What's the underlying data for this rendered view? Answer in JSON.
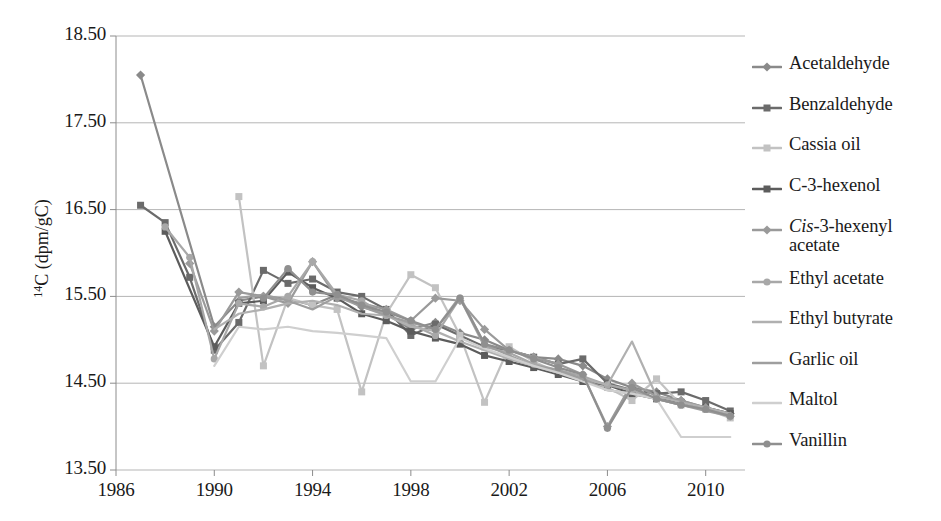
{
  "chart_data": {
    "type": "line",
    "title": "",
    "xlabel": "",
    "ylabel": "14C (dpm/gC)",
    "ylabel_sup": "14",
    "ylabel_rest": "C (dpm/gC)",
    "xlim": [
      1986,
      2011.6
    ],
    "ylim": [
      13.5,
      18.5
    ],
    "grid": true,
    "legend_position": "right",
    "y_ticks": [
      "18.50",
      "17.50",
      "16.50",
      "15.50",
      "14.50",
      "13.50"
    ],
    "y_tick_values": [
      18.5,
      17.5,
      16.5,
      15.5,
      14.5,
      13.5
    ],
    "x_ticks": [
      "1986",
      "1990",
      "1994",
      "1998",
      "2002",
      "2006",
      "2010"
    ],
    "x_tick_values": [
      1986,
      1990,
      1994,
      1998,
      2002,
      2006,
      2010
    ],
    "series": [
      {
        "name": "Acetaldehyde",
        "color": "#8a8a8a",
        "marker": "diamond",
        "x": [
          1987,
          1990,
          1991,
          1992,
          1993,
          1994,
          1995,
          1996,
          1997,
          1998,
          1999,
          2000,
          2001,
          2002,
          2003,
          2004,
          2005,
          2006,
          2007,
          2008,
          2009,
          2010,
          2011
        ],
        "values": [
          18.05,
          15.15,
          15.45,
          15.5,
          15.47,
          15.4,
          15.52,
          15.38,
          15.3,
          15.12,
          15.2,
          15.08,
          15.0,
          14.88,
          14.8,
          14.78,
          14.7,
          14.55,
          14.45,
          14.4,
          14.3,
          14.22,
          14.15
        ]
      },
      {
        "name": "Benzaldehyde",
        "color": "#6b6b6b",
        "marker": "square",
        "x": [
          1987,
          1988,
          1989,
          1990,
          1991,
          1992,
          1993,
          1994,
          1995,
          1996,
          1997,
          1998,
          1999,
          2000,
          2001,
          2002,
          2003,
          2004,
          2005,
          2006,
          2007,
          2008,
          2009,
          2010,
          2011
        ],
        "values": [
          16.55,
          16.35,
          15.72,
          14.88,
          15.2,
          15.8,
          15.65,
          15.7,
          15.55,
          15.5,
          15.35,
          15.05,
          15.18,
          15.05,
          14.92,
          14.88,
          14.8,
          14.72,
          14.78,
          14.5,
          14.42,
          14.38,
          14.4,
          14.3,
          14.18
        ]
      },
      {
        "name": "Cassia oil",
        "color": "#c2c2c2",
        "marker": "square",
        "x": [
          1991,
          1992,
          1993,
          1994,
          1995,
          1996,
          1997,
          1998,
          1999,
          2000,
          2001,
          2002,
          2003,
          2004,
          2005,
          2006,
          2007,
          2008,
          2009,
          2010,
          2011
        ],
        "values": [
          16.65,
          14.7,
          15.48,
          15.4,
          15.35,
          14.4,
          15.3,
          15.75,
          15.6,
          15.05,
          14.28,
          14.92,
          14.75,
          14.62,
          14.55,
          14.45,
          14.3,
          14.55,
          14.25,
          14.2,
          14.1
        ]
      },
      {
        "name": "C-3-hexenol",
        "color": "#5c5c5c",
        "marker": "square",
        "x": [
          1988,
          1990,
          1991,
          1992,
          1993,
          1994,
          1995,
          1996,
          1997,
          1998,
          1999,
          2000,
          2001,
          2002,
          2003,
          2004,
          2005,
          2006,
          2007,
          2008,
          2009,
          2010,
          2011
        ],
        "values": [
          16.25,
          14.92,
          15.42,
          15.45,
          15.78,
          15.6,
          15.48,
          15.3,
          15.22,
          15.1,
          15.02,
          14.95,
          14.82,
          14.75,
          14.68,
          14.6,
          14.52,
          14.48,
          14.38,
          14.32,
          14.28,
          14.22,
          14.15
        ]
      },
      {
        "name": "Cis-3-hexenyl acetate",
        "color": "#9a9a9a",
        "marker": "diamond",
        "italic_prefix": "Cis",
        "x": [
          1989,
          1990,
          1991,
          1992,
          1993,
          1994,
          1995,
          1996,
          1997,
          1998,
          1999,
          2000,
          2001,
          2002,
          2003,
          2004,
          2005,
          2006,
          2007,
          2008,
          2009,
          2010,
          2011
        ],
        "values": [
          15.88,
          15.1,
          15.55,
          15.5,
          15.42,
          15.9,
          15.48,
          15.42,
          15.35,
          15.22,
          15.48,
          15.45,
          15.12,
          14.88,
          14.8,
          14.72,
          14.6,
          14.0,
          14.5,
          14.35,
          14.3,
          14.22,
          14.12
        ]
      },
      {
        "name": "Ethyl acetate",
        "color": "#a8a8a8",
        "marker": "circle",
        "x": [
          1988,
          1989,
          1990,
          1991,
          1992,
          1993,
          1994,
          1995,
          1996,
          1997,
          1998,
          1999,
          2000,
          2001,
          2002,
          2003,
          2004,
          2005,
          2006,
          2007,
          2008,
          2009,
          2010,
          2011
        ],
        "values": [
          16.3,
          15.95,
          14.78,
          15.42,
          15.38,
          15.5,
          15.9,
          15.52,
          15.45,
          15.28,
          15.18,
          15.05,
          15.48,
          14.92,
          14.85,
          14.72,
          14.65,
          14.58,
          14.48,
          14.42,
          14.32,
          14.25,
          14.2,
          14.12
        ]
      },
      {
        "name": "Ethyl butyrate",
        "color": "#b0b0b0",
        "marker": "none",
        "x": [
          1990,
          1991,
          1992,
          1993,
          1994,
          1995,
          1996,
          1997,
          1998,
          1999,
          2000,
          2001,
          2002,
          2003,
          2004,
          2005,
          2006,
          2007,
          2008,
          2009,
          2010,
          2011
        ],
        "values": [
          15.12,
          15.3,
          15.35,
          15.42,
          15.45,
          15.4,
          15.3,
          15.28,
          15.15,
          15.1,
          14.98,
          14.88,
          14.78,
          14.7,
          14.62,
          14.55,
          14.48,
          14.98,
          14.35,
          14.28,
          14.22,
          14.15
        ]
      },
      {
        "name": "Garlic oil",
        "color": "#9e9e9e",
        "marker": "none",
        "x": [
          1991,
          1992,
          1993,
          1994,
          1995,
          1996,
          1997,
          1998,
          1999,
          2000,
          2001,
          2002,
          2003,
          2004,
          2005,
          2006,
          2007,
          2008,
          2009,
          2010,
          2011
        ],
        "values": [
          15.48,
          15.52,
          15.45,
          15.35,
          15.5,
          15.38,
          15.28,
          15.2,
          15.12,
          15.5,
          14.95,
          14.82,
          14.7,
          14.65,
          14.55,
          14.42,
          14.38,
          14.32,
          14.25,
          14.18,
          14.12
        ]
      },
      {
        "name": "Maltol",
        "color": "#cfcfcf",
        "marker": "none",
        "x": [
          1990,
          1991,
          1992,
          1993,
          1994,
          1995,
          1996,
          1997,
          1998,
          1999,
          2000,
          2001,
          2002,
          2003,
          2004,
          2005,
          2006,
          2007,
          2008,
          2009,
          2010,
          2011
        ],
        "values": [
          14.7,
          15.15,
          15.12,
          15.15,
          15.1,
          15.08,
          15.05,
          15.02,
          14.52,
          14.52,
          15.02,
          14.9,
          14.8,
          14.7,
          14.62,
          14.52,
          14.42,
          14.38,
          14.32,
          13.88,
          13.88,
          13.88
        ]
      },
      {
        "name": "Vanillin",
        "color": "#8f8f8f",
        "marker": "circle",
        "x": [
          1992,
          1993,
          1994,
          1995,
          1996,
          1997,
          1998,
          1999,
          2000,
          2001,
          2002,
          2003,
          2004,
          2005,
          2006,
          2007,
          2008,
          2009,
          2010,
          2011
        ],
        "values": [
          15.48,
          15.82,
          15.55,
          15.52,
          15.4,
          15.32,
          15.22,
          15.12,
          15.48,
          14.95,
          14.88,
          14.78,
          14.68,
          14.6,
          13.98,
          14.45,
          14.32,
          14.25,
          14.2,
          14.12
        ]
      }
    ]
  },
  "legend": {
    "items": [
      {
        "label": "Acetaldehyde",
        "color": "#8a8a8a",
        "marker": "diamond"
      },
      {
        "label": "Benzaldehyde",
        "color": "#6b6b6b",
        "marker": "square"
      },
      {
        "label": "Cassia oil",
        "color": "#c2c2c2",
        "marker": "square"
      },
      {
        "label": "C-3-hexenol",
        "color": "#5c5c5c",
        "marker": "square"
      },
      {
        "label": "Cis-3-hexenyl acetate",
        "color": "#9a9a9a",
        "marker": "diamond"
      },
      {
        "label": "Ethyl acetate",
        "color": "#a8a8a8",
        "marker": "circle"
      },
      {
        "label": "Ethyl butyrate",
        "color": "#b0b0b0",
        "marker": "none"
      },
      {
        "label": "Garlic oil",
        "color": "#9e9e9e",
        "marker": "none"
      },
      {
        "label": "Maltol",
        "color": "#cfcfcf",
        "marker": "none"
      },
      {
        "label": "Vanillin",
        "color": "#8f8f8f",
        "marker": "circle"
      }
    ]
  },
  "axes": {
    "grid_color": "#b5b5b5",
    "axis_color": "#8c8c8c",
    "text_color": "#1a1a1a"
  }
}
